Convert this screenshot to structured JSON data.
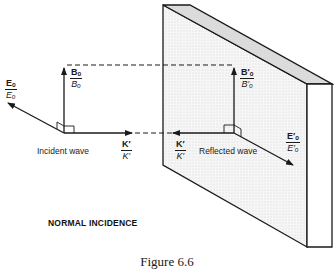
{
  "figure": {
    "caption": "Figure 6.6",
    "title": "NORMAL INCIDENCE"
  },
  "labels": {
    "incident_wave": "Incident wave",
    "reflected_wave": "Reflected wave"
  },
  "vectors": {
    "incident": {
      "E": {
        "num": "Eₒ",
        "den": "Eₒ"
      },
      "B": {
        "num": "Bₒ",
        "den": "Bₒ"
      },
      "K": {
        "num": "K′",
        "den": "K′"
      }
    },
    "reflected": {
      "E": {
        "num": "E′ₒ",
        "den": "E′ₒ"
      },
      "B": {
        "num": "B′ₒ",
        "den": "B′ₒ"
      },
      "K": {
        "num": "K′",
        "den": "K′"
      }
    }
  },
  "colors": {
    "line": "#1a1a1a",
    "plane_face": "#f3f3f3",
    "plane_top": "#dedede",
    "background": "#ffffff"
  }
}
